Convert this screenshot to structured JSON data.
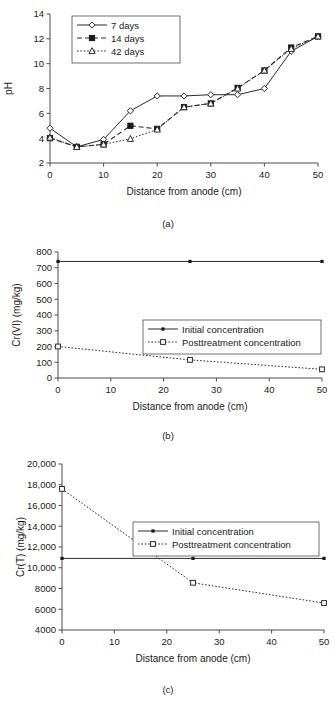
{
  "figure": {
    "panels": [
      "(a)",
      "(b)",
      "(c)"
    ]
  },
  "chart_data": [
    {
      "type": "line",
      "panel": "(a)",
      "title": "",
      "xlabel": "Distance from anode (cm)",
      "ylabel": "pH",
      "xlim": [
        0,
        50
      ],
      "ylim": [
        2,
        14
      ],
      "xticks": [
        0,
        10,
        20,
        30,
        40,
        50
      ],
      "yticks": [
        2,
        4,
        6,
        8,
        10,
        12,
        14
      ],
      "xticklabels": [
        "0",
        "10",
        "20",
        "30",
        "40",
        "50"
      ],
      "yticklabels": [
        "2",
        "4",
        "6",
        "8",
        "10",
        "12",
        "14"
      ],
      "grid": false,
      "legend_position": "upper left",
      "x": [
        0,
        5,
        10,
        15,
        20,
        25,
        30,
        35,
        40,
        45,
        50
      ],
      "series": [
        {
          "name": "7 days",
          "marker": "open-diamond",
          "linestyle": "solid",
          "values": [
            4.8,
            3.3,
            3.9,
            6.2,
            7.4,
            7.4,
            7.5,
            7.5,
            8.0,
            11.0,
            12.2
          ]
        },
        {
          "name": "14 days",
          "marker": "filled-square",
          "linestyle": "dashed",
          "values": [
            4.0,
            3.3,
            3.5,
            5.0,
            4.75,
            6.5,
            6.8,
            8.05,
            9.45,
            11.3,
            12.2
          ]
        },
        {
          "name": "42 days",
          "marker": "open-triangle",
          "linestyle": "dotted",
          "values": [
            4.05,
            3.3,
            3.5,
            3.95,
            4.7,
            6.5,
            6.8,
            8.0,
            9.45,
            11.2,
            12.2
          ]
        }
      ]
    },
    {
      "type": "line",
      "panel": "(b)",
      "title": "",
      "xlabel": "Distance from anode (cm)",
      "ylabel": "Cr(VI) (mg/kg)",
      "xlim": [
        0,
        50
      ],
      "ylim": [
        0,
        800
      ],
      "xticks": [
        0,
        10,
        20,
        30,
        40,
        50
      ],
      "yticks": [
        0,
        100,
        200,
        300,
        400,
        500,
        600,
        700,
        800
      ],
      "xticklabels": [
        "0",
        "10",
        "20",
        "30",
        "40",
        "50"
      ],
      "yticklabels": [
        "0",
        "100",
        "200",
        "300",
        "400",
        "500",
        "600",
        "700",
        "800"
      ],
      "grid": false,
      "legend_position": "center right",
      "x": [
        0,
        25,
        50
      ],
      "series": [
        {
          "name": "Initial concentration",
          "marker": "small-dot",
          "linestyle": "solid",
          "values": [
            740,
            740,
            740
          ]
        },
        {
          "name": "Posttreatment concentration",
          "marker": "open-square",
          "linestyle": "dotted",
          "values": [
            200,
            115,
            55
          ]
        }
      ]
    },
    {
      "type": "line",
      "panel": "(c)",
      "title": "",
      "xlabel": "Distance from anode (cm)",
      "ylabel": "Cr(T) (mg/kg)",
      "xlim": [
        0,
        50
      ],
      "ylim": [
        4000,
        20000
      ],
      "xticks": [
        0,
        10,
        20,
        30,
        40,
        50
      ],
      "yticks": [
        4000,
        6000,
        8000,
        10000,
        12000,
        14000,
        16000,
        18000,
        20000
      ],
      "xticklabels": [
        "0",
        "10",
        "20",
        "30",
        "40",
        "50"
      ],
      "yticklabels": [
        "4000",
        "6000",
        "8000",
        "10,000",
        "12,000",
        "14,000",
        "16,000",
        "18,000",
        "20,000"
      ],
      "grid": false,
      "legend_position": "upper right",
      "x": [
        0,
        25,
        50
      ],
      "series": [
        {
          "name": "Initial concentration",
          "marker": "small-dot",
          "linestyle": "solid",
          "values": [
            10900,
            10900,
            10900
          ]
        },
        {
          "name": "Posttreatment concentration",
          "marker": "open-square",
          "linestyle": "dotted",
          "values": [
            17600,
            8550,
            6600
          ]
        }
      ]
    }
  ]
}
